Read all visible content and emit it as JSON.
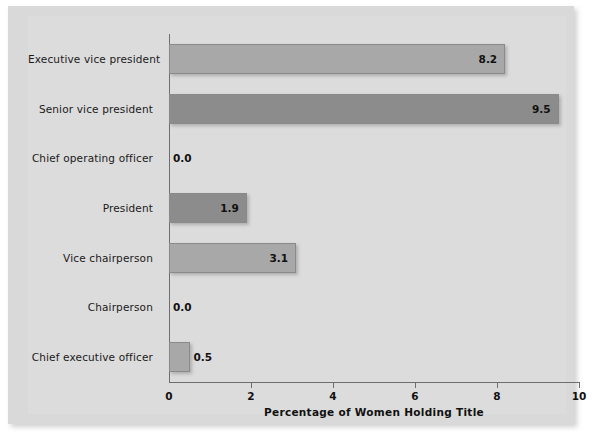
{
  "chart_data": {
    "type": "bar",
    "orientation": "horizontal",
    "title": "",
    "xlabel": "Percentage of Women Holding Title",
    "ylabel": "",
    "xlim": [
      0,
      10
    ],
    "xticks": [
      "0",
      "2",
      "4",
      "6",
      "8",
      "10"
    ],
    "xtick_values": [
      0,
      2,
      4,
      6,
      8,
      10
    ],
    "grid": false,
    "legend": false,
    "categories": [
      "Executive vice president",
      "Senior vice president",
      "Chief operating officer",
      "President",
      "Vice chairperson",
      "Chairperson",
      "Chief executive officer"
    ],
    "values": [
      8.2,
      9.5,
      0.0,
      1.9,
      3.1,
      0.0,
      0.5
    ],
    "value_labels": [
      "8.2",
      "9.5",
      "0.0",
      "1.9",
      "3.1",
      "0.0",
      "0.5"
    ],
    "bar_shades": [
      "light",
      "dark",
      "light",
      "dark",
      "light",
      "dark",
      "light"
    ]
  },
  "colors": {
    "panel_background": "#d9d9d9",
    "plot_background": "#dcdcdc",
    "bar_light": "#a8a8a8",
    "bar_dark": "#8c8c8c",
    "bar_border": "#8a8a8a",
    "axis": "#6e6e6e",
    "text": "#111111"
  }
}
